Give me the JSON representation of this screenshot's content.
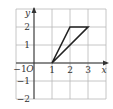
{
  "diagram": {
    "type": "coordinate-grid",
    "grid": {
      "x_min": -1,
      "x_max": 4,
      "y_min": -2,
      "y_max": 3,
      "cell_px": 18,
      "origin_px": [
        34,
        63
      ],
      "line_color": "#b8b8b8"
    },
    "axes": {
      "x_label": "x",
      "y_label": "y",
      "origin_label": "O",
      "color": "#333333"
    },
    "x_ticks": [
      {
        "value": -1,
        "label": "−1"
      },
      {
        "value": 1,
        "label": "1"
      },
      {
        "value": 2,
        "label": "2"
      },
      {
        "value": 3,
        "label": "3"
      }
    ],
    "y_ticks": [
      {
        "value": 2,
        "label": "2"
      },
      {
        "value": 1,
        "label": "1"
      },
      {
        "value": -1,
        "label": "−1"
      },
      {
        "value": -2,
        "label": "−2"
      }
    ],
    "shape": {
      "name": "triangle",
      "vertices": [
        [
          1,
          0
        ],
        [
          2,
          2
        ],
        [
          3,
          2
        ]
      ],
      "stroke": "#222222",
      "stroke_width": 1.6
    }
  }
}
